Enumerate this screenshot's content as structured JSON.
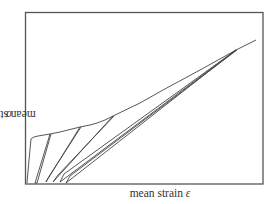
{
  "chart_data": {
    "type": "line",
    "title": "",
    "xlabel": "mean strain ε",
    "ylabel": "mean stress σ",
    "xlabel_text": "mean strain",
    "xlabel_symbol": "ε",
    "ylabel_text": "mean stress",
    "ylabel_symbol": "σ",
    "ticks": "none",
    "grid": false,
    "legend": null,
    "frame": {
      "x0": 25,
      "y0": 12,
      "x1": 263,
      "y1": 184
    },
    "line_color": "#444444",
    "series": [
      {
        "name": "loading-envelope",
        "points_px": [
          [
            27,
            183
          ],
          [
            29,
            160
          ],
          [
            31,
            139
          ],
          [
            34,
            137
          ],
          [
            38,
            136
          ],
          [
            50,
            134
          ],
          [
            60,
            132
          ],
          [
            72,
            129
          ],
          [
            80,
            127
          ],
          [
            90,
            125
          ],
          [
            97,
            123
          ],
          [
            105,
            120
          ],
          [
            113,
            116
          ],
          [
            140,
            103
          ],
          [
            163,
            90
          ],
          [
            200,
            70
          ],
          [
            236,
            50
          ],
          [
            256,
            40
          ]
        ]
      },
      {
        "name": "unload-reload-1",
        "points_px": [
          [
            50,
            134
          ],
          [
            35,
            183
          ],
          [
            37,
            183
          ],
          [
            51,
            134
          ]
        ]
      },
      {
        "name": "unload-reload-2",
        "points_px": [
          [
            80,
            127
          ],
          [
            46,
            182
          ],
          [
            48,
            178
          ],
          [
            81,
            127
          ]
        ]
      },
      {
        "name": "unload-reload-3",
        "points_px": [
          [
            113,
            116
          ],
          [
            53,
            182
          ],
          [
            58,
            175
          ],
          [
            114,
            116
          ]
        ]
      },
      {
        "name": "unload-reload-4a",
        "points_px": [
          [
            236,
            50
          ],
          [
            60,
            182
          ],
          [
            64,
            174
          ],
          [
            236,
            50
          ]
        ]
      },
      {
        "name": "unload-reload-4b",
        "points_px": [
          [
            236,
            50
          ],
          [
            66,
            183
          ],
          [
            70,
            176
          ],
          [
            237,
            50
          ]
        ]
      }
    ]
  }
}
